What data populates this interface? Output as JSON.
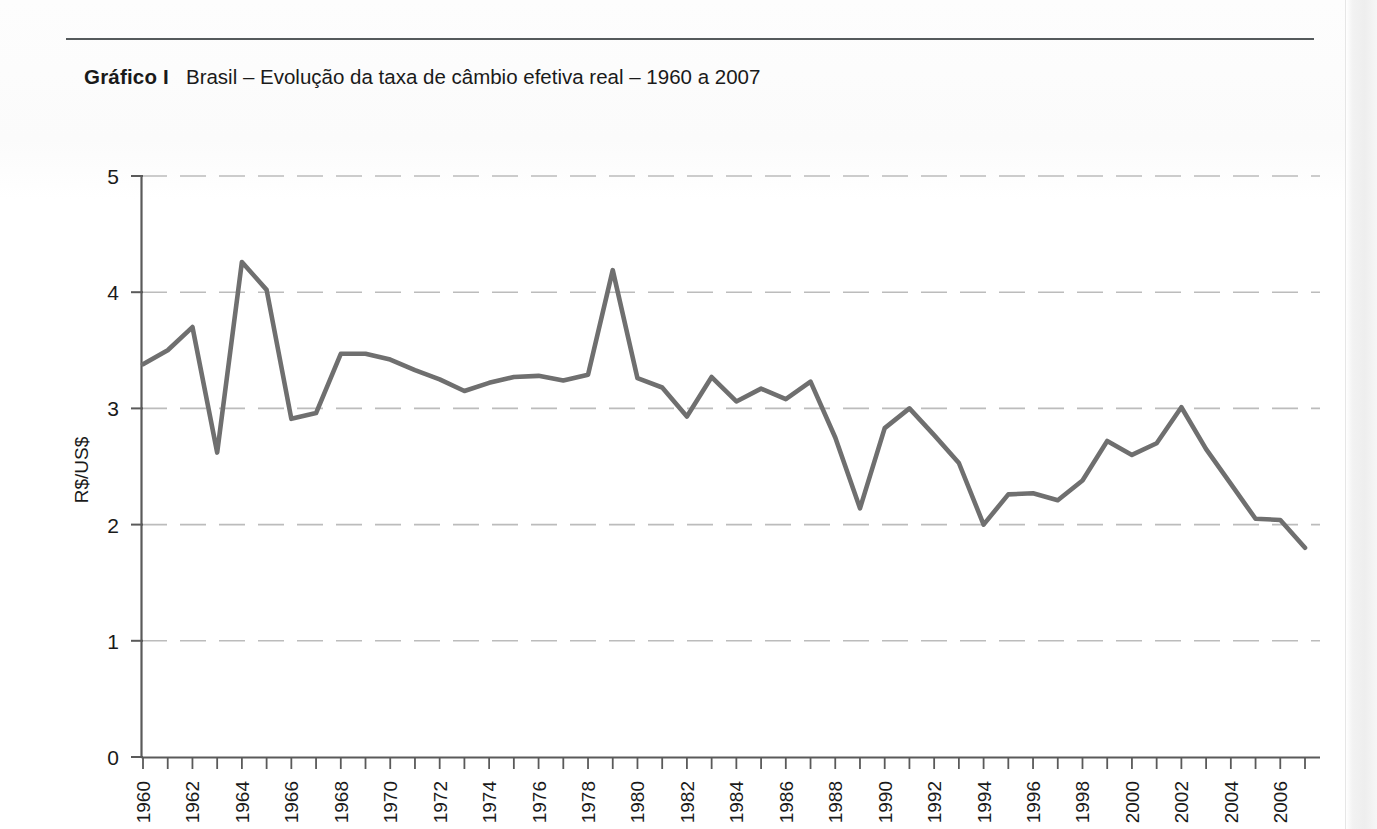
{
  "caption": {
    "label": "Gráfico I",
    "text": "Brasil – Evolução da taxa de câmbio efetiva real – 1960 a 2007"
  },
  "colors": {
    "line": "#6f6f6f",
    "axis": "#5a5a5a",
    "grid": "#bcbcbc",
    "rule": "#555a5c",
    "text": "#1a1a1a"
  },
  "chart_data": {
    "type": "line",
    "title": "Brasil – Evolução da taxa de câmbio efetiva real – 1960 a 2007",
    "xlabel": "",
    "ylabel": "R$/US$",
    "ylim": [
      0,
      5
    ],
    "xlim": [
      1960,
      2007
    ],
    "yticks": [
      "0",
      "1",
      "2",
      "3",
      "4",
      "5"
    ],
    "ytick_values": [
      0,
      1,
      2,
      3,
      4,
      5
    ],
    "grid": "horizontal-dashed",
    "legend": "none",
    "xtick_labels": [
      "1960",
      "1962",
      "1964",
      "1966",
      "1968",
      "1970",
      "1972",
      "1974",
      "1976",
      "1978",
      "1980",
      "1982",
      "1984",
      "1986",
      "1988",
      "1990",
      "1992",
      "1994",
      "1996",
      "1998",
      "2000",
      "2002",
      "2004",
      "2006"
    ],
    "xtick_label_rotation": 90,
    "xtick_label_step": 2,
    "x": [
      1960,
      1961,
      1962,
      1963,
      1964,
      1965,
      1966,
      1967,
      1968,
      1969,
      1970,
      1971,
      1972,
      1973,
      1974,
      1975,
      1976,
      1977,
      1978,
      1979,
      1980,
      1981,
      1982,
      1983,
      1984,
      1985,
      1986,
      1987,
      1988,
      1989,
      1990,
      1991,
      1992,
      1993,
      1994,
      1995,
      1996,
      1997,
      1998,
      1999,
      2000,
      2001,
      2002,
      2003,
      2004,
      2005,
      2006,
      2007
    ],
    "values": [
      3.38,
      3.5,
      3.7,
      2.62,
      4.26,
      4.02,
      2.91,
      2.96,
      3.47,
      3.47,
      3.42,
      3.33,
      3.25,
      3.15,
      3.22,
      3.27,
      3.28,
      3.24,
      3.29,
      4.19,
      3.26,
      3.18,
      2.93,
      3.27,
      3.06,
      3.17,
      3.08,
      3.23,
      2.75,
      2.14,
      2.83,
      3.0,
      2.77,
      2.53,
      2.0,
      2.26,
      2.27,
      2.21,
      2.38,
      2.72,
      2.6,
      2.7,
      3.01,
      2.65,
      2.35,
      2.05,
      2.04,
      1.8
    ],
    "series": [
      {
        "name": "Taxa de câmbio efetiva real",
        "values": [
          3.38,
          3.5,
          3.7,
          2.62,
          4.26,
          4.02,
          2.91,
          2.96,
          3.47,
          3.47,
          3.42,
          3.33,
          3.25,
          3.15,
          3.22,
          3.27,
          3.28,
          3.24,
          3.29,
          4.19,
          3.26,
          3.18,
          2.93,
          3.27,
          3.06,
          3.17,
          3.08,
          3.23,
          2.75,
          2.14,
          2.83,
          3.0,
          2.77,
          2.53,
          2.0,
          2.26,
          2.27,
          2.21,
          2.38,
          2.72,
          2.6,
          2.7,
          3.01,
          2.65,
          2.35,
          2.05,
          2.04,
          1.8
        ]
      }
    ]
  }
}
